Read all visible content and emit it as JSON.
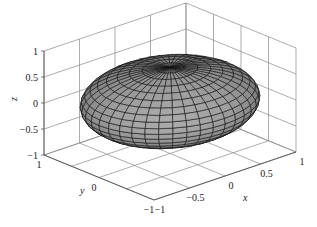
{
  "chart_data": {
    "type": "surface3d",
    "title": "",
    "surface": {
      "shape": "ellipsoid",
      "semi_axes": {
        "x": 1,
        "y": 1,
        "z": 0.65
      },
      "center": [
        0,
        0,
        0
      ],
      "meshlines_u": 40,
      "meshlines_v": 20,
      "face_color": "#9a9a9a",
      "edge_color": "#000000"
    },
    "xlabel": "x",
    "ylabel": "y",
    "zlabel": "z",
    "xlim": [
      -1,
      1
    ],
    "ylim": [
      -1,
      1
    ],
    "zlim": [
      -1,
      1
    ],
    "xticks": [
      "-1",
      "-0.5",
      "0",
      "0.5",
      "1"
    ],
    "yticks": [
      "-1",
      "0",
      "1"
    ],
    "zticks": [
      "-1",
      "-0.5",
      "0",
      "0.5",
      "1"
    ],
    "grid": true,
    "box": true
  },
  "axes": {
    "x_label": "x",
    "y_label": "y",
    "z_label": "z",
    "x_ticks": [
      {
        "label": "-1",
        "v": -1
      },
      {
        "label": "-0.5",
        "v": -0.5
      },
      {
        "label": "0",
        "v": 0
      },
      {
        "label": "0.5",
        "v": 0.5
      },
      {
        "label": "1",
        "v": 1
      }
    ],
    "y_ticks": [
      {
        "label": "-1",
        "v": -1
      },
      {
        "label": "0",
        "v": 0
      },
      {
        "label": "1",
        "v": 1
      }
    ],
    "z_ticks": [
      {
        "label": "-1",
        "v": -1
      },
      {
        "label": "-0.5",
        "v": -0.5
      },
      {
        "label": "0",
        "v": 0
      },
      {
        "label": "0.5",
        "v": 0.5
      },
      {
        "label": "1",
        "v": 1
      }
    ]
  }
}
